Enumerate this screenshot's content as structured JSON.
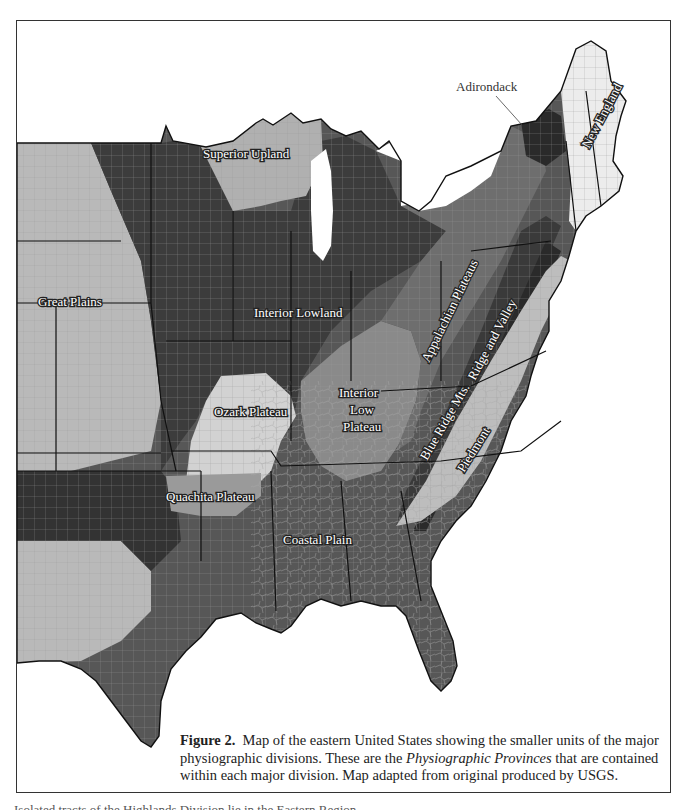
{
  "figure": {
    "number_label": "Figure 2.",
    "caption_part1": "Map of the eastern United States showing the smaller units of the major physiographic divisions. These are the ",
    "caption_italic": "Physiographic Provinces",
    "caption_part2": " that are contained within each major division. Map adapted from original produced by USGS."
  },
  "map": {
    "title": "Physiographic provinces of the eastern United States",
    "colors": {
      "great_plains": "#b9b9b9",
      "interior_lowland": "#3c3c3c",
      "superior_upland": "#b0b0b0",
      "ozark_plateau": "#d2d2d2",
      "quachita_plateau": "#9a9a9a",
      "interior_low_plateau": "#8a8a8a",
      "appalachian_plateaus": "#6e6e6e",
      "ridge_and_valley": "#3a3a3a",
      "blue_ridge": "#2e2e2e",
      "piedmont": "#bdbdbd",
      "coastal_plain": "#575757",
      "new_england": "#ececec",
      "adirondack": "#2a2a2a",
      "water": "#ffffff",
      "state_border": "#111111",
      "county_lines": "#c8c8c8"
    },
    "labels": {
      "great_plains": "Great Plains",
      "superior_upland": "Superior Upland",
      "interior_lowland": "Interior Lowland",
      "ozark_plateau": "Ozark Plateau",
      "quachita_plateau": "Quachita Plateau",
      "interior_low_plateau_1": "Interior",
      "interior_low_plateau_2": "Low",
      "interior_low_plateau_3": "Plateau",
      "appalachian_plateaus": "Appalachian Plateaus",
      "ridge_and_valley": "Ridge and Valley",
      "blue_ridge": "Blue Ridge Mts.",
      "piedmont": "Piedmont",
      "coastal_plain": "Coastal Plain",
      "new_england": "New England",
      "adirondack": "Adirondack"
    }
  },
  "bottom_text": "Isolated tracts of the Highlands Division lie in the Eastern Region ..."
}
